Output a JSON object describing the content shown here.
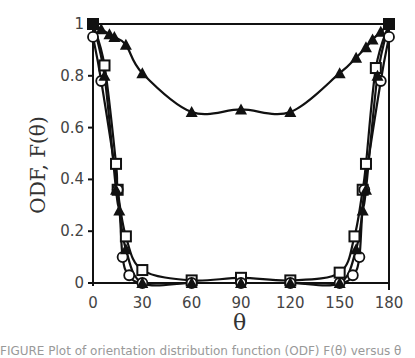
{
  "chart_data": {
    "type": "line",
    "title": "",
    "xlabel": "θ",
    "ylabel": "ODF, F(θ)",
    "xlim": [
      0,
      180
    ],
    "ylim": [
      0,
      1
    ],
    "xticks": [
      0,
      30,
      60,
      90,
      120,
      150,
      180
    ],
    "yticks": [
      0,
      0.2,
      0.4,
      0.6,
      0.8,
      1
    ],
    "ytick_labels": [
      "0",
      "0.2",
      "0.4",
      "0.6",
      "0.8",
      "1"
    ],
    "grid": false,
    "legend": null,
    "series": [
      {
        "name": "filled-triangle (broad)",
        "marker": "triangle",
        "x": [
          0,
          5,
          10,
          13,
          20,
          30,
          60,
          90,
          120,
          150,
          160,
          166,
          170,
          175,
          180
        ],
        "y": [
          1.0,
          0.98,
          0.96,
          0.95,
          0.92,
          0.81,
          0.66,
          0.67,
          0.66,
          0.81,
          0.87,
          0.91,
          0.94,
          0.97,
          1.0
        ]
      },
      {
        "name": "open-square",
        "marker": "square",
        "x": [
          0,
          7,
          14,
          15,
          20,
          30,
          60,
          90,
          120,
          150,
          159,
          164,
          166,
          172,
          180
        ],
        "y": [
          1.0,
          0.84,
          0.46,
          0.36,
          0.18,
          0.05,
          0.01,
          0.02,
          0.01,
          0.04,
          0.18,
          0.36,
          0.46,
          0.83,
          1.0
        ]
      },
      {
        "name": "open-circle",
        "marker": "circle",
        "x": [
          0,
          5,
          15,
          18,
          22,
          30,
          60,
          90,
          120,
          150,
          158,
          162,
          165,
          175,
          180
        ],
        "y": [
          0.95,
          0.78,
          0.36,
          0.1,
          0.03,
          0.0,
          0.0,
          0.0,
          0.0,
          0.0,
          0.03,
          0.1,
          0.36,
          0.78,
          0.95
        ]
      },
      {
        "name": "filled-triangle (narrow)",
        "marker": "triangle",
        "x": [
          0,
          7,
          14,
          16,
          20,
          30,
          60,
          90,
          120,
          150,
          160,
          164,
          166,
          173,
          180
        ],
        "y": [
          1.0,
          0.8,
          0.36,
          0.28,
          0.13,
          0.0,
          0.0,
          0.0,
          0.0,
          0.0,
          0.13,
          0.28,
          0.36,
          0.8,
          1.0
        ]
      }
    ]
  },
  "labels": {
    "ylabel": "ODF, F(θ)",
    "xlabel": "θ",
    "caption": "FIGURE  Plot of orientation distribution function (ODF) F(θ) versus θ"
  }
}
